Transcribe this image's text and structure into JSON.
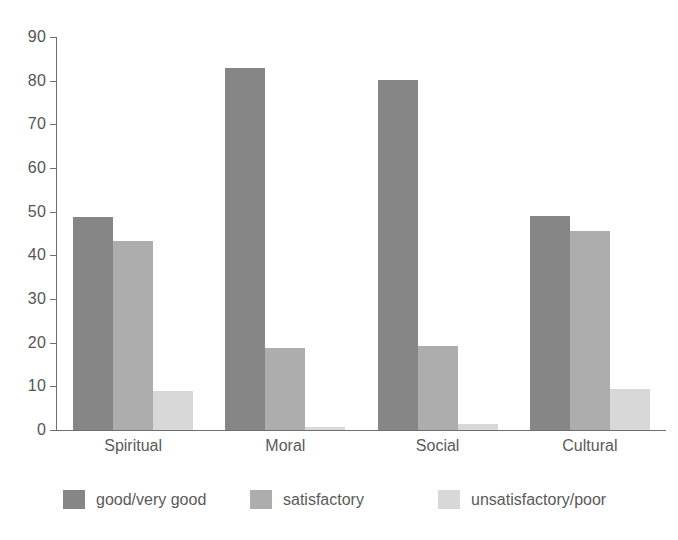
{
  "chart_data": {
    "type": "bar",
    "title": "",
    "subtitle": "",
    "xlabel": "",
    "ylabel": "",
    "categories": [
      "Spiritual",
      "Moral",
      "Social",
      "Cultural"
    ],
    "series": [
      {
        "name": "good/very good",
        "color": "#868686",
        "values": [
          48.7,
          82.8,
          80.2,
          49.0
        ]
      },
      {
        "name": "satisfactory",
        "color": "#adadad",
        "values": [
          43.4,
          18.8,
          19.2,
          45.5
        ]
      },
      {
        "name": "unsatisfactory/poor",
        "color": "#d8d8d8",
        "values": [
          9.0,
          0.7,
          1.3,
          9.4
        ]
      }
    ],
    "ylim": [
      0,
      90
    ],
    "ytick_step": 10,
    "yticks": [
      0,
      10,
      20,
      30,
      40,
      50,
      60,
      70,
      80,
      90
    ],
    "ytick_labels": [
      "0",
      "10",
      "20",
      "30",
      "40",
      "50",
      "60",
      "70",
      "80",
      "90"
    ],
    "grid": false,
    "legend_position": "bottom",
    "axis_color": "#6f6f6f",
    "text_color": "#5a5a5a",
    "background": "#ffffff"
  },
  "legend": {
    "items": [
      {
        "label": "good/very good",
        "swatch": "s0"
      },
      {
        "label": "satisfactory",
        "swatch": "s1"
      },
      {
        "label": "unsatisfactory/poor",
        "swatch": "s2"
      }
    ]
  }
}
